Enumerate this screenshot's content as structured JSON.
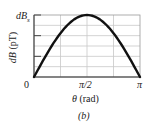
{
  "chart_data": {
    "type": "line",
    "title": "",
    "xlabel": "θ (rad)",
    "ylabel": "dB (pT)",
    "caption": "(b)",
    "x_ticks": [
      "0",
      "π/2",
      "π"
    ],
    "y_ticks": [
      "dB_s"
    ],
    "y_top_label_main": "dB",
    "y_top_label_sub": "s",
    "xlim": [
      0,
      3.1416
    ],
    "ylim": [
      0,
      1
    ],
    "grid": true,
    "x_grid_divisions": 4,
    "y_grid_divisions": 6,
    "series": [
      {
        "name": "dB(θ)",
        "x": [
          0,
          0.3927,
          0.7854,
          1.1781,
          1.5708,
          1.9635,
          2.3562,
          2.7489,
          3.1416
        ],
        "y": [
          0,
          0.383,
          0.707,
          0.924,
          1.0,
          0.924,
          0.707,
          0.383,
          0
        ]
      }
    ],
    "colors": {
      "curve": "#111111",
      "grid": "#c8c8c8",
      "axis": "#444444"
    }
  },
  "labels": {
    "x0": "0",
    "xmid": "π/2",
    "xend": "π",
    "xlabel_theta": "θ",
    "xlabel_unit": "(rad)",
    "ylabel_d": "dB",
    "ylabel_unit": "(pT)",
    "ytop_main": "dB",
    "ytop_sub": "s",
    "caption": "(b)"
  }
}
